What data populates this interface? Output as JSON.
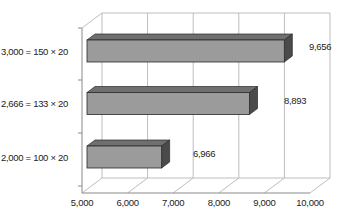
{
  "chart_data": {
    "type": "bar",
    "orientation": "horizontal",
    "style": "3d",
    "title": "",
    "xlabel": "",
    "ylabel": "",
    "categories": [
      "3,000 = 150 × 20",
      "2,666 = 133 × 20",
      "2,000 = 100 × 20"
    ],
    "values": [
      9656,
      8893,
      6966
    ],
    "value_labels": [
      "9,656",
      "8,893",
      "6,966"
    ],
    "xlim": [
      5000,
      10000
    ],
    "x_ticks": [
      5000,
      6000,
      7000,
      8000,
      9000,
      10000
    ],
    "x_tick_labels": [
      "5,000",
      "6,000",
      "7,000",
      "8,000",
      "9,000",
      "10,000"
    ],
    "grid": true,
    "legend": null,
    "colors": {
      "bar_front": "#9b9b9b",
      "bar_top": "#6f6f6f",
      "bar_side": "#4a4a4a",
      "bar_edge": "#2a2a2a",
      "grid": "#bdbdbd",
      "axis": "#8a8a8a"
    }
  }
}
